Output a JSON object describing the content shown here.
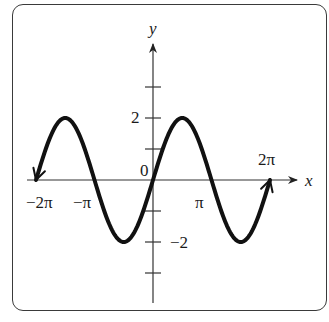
{
  "chart_data": {
    "type": "line",
    "title": "",
    "function": "y = 2 sin x",
    "xlabel": "x",
    "ylabel": "y",
    "xlim": [
      -6.2832,
      6.2832
    ],
    "ylim": [
      -4,
      4
    ],
    "grid": false,
    "x_tick_labels": [
      "−2π",
      "−π",
      "π",
      "2π"
    ],
    "x_tick_values": [
      -6.2832,
      -3.1416,
      3.1416,
      6.2832
    ],
    "y_tick_values": [
      -3,
      -2,
      -1,
      1,
      2,
      3
    ],
    "y_tick_labels": {
      "2": "2",
      "-2": "−2"
    },
    "origin_label": "0",
    "series": [
      {
        "name": "2 sin x",
        "x": [
          -6.2832,
          -4.7124,
          -3.1416,
          -1.5708,
          0,
          1.5708,
          3.1416,
          4.7124,
          6.2832
        ],
        "values": [
          0,
          2,
          0,
          -2,
          0,
          2,
          0,
          -2,
          0
        ],
        "end_arrows": true
      }
    ],
    "colors": {
      "curve": "#111111",
      "axes": "#333333",
      "frame": "#3a3a3a"
    }
  },
  "labels": {
    "x_axis": "x",
    "y_axis": "y",
    "origin": "0",
    "neg_two_pi": "−2π",
    "neg_pi": "−π",
    "pi": "π",
    "two_pi": "2π",
    "y_two": "2",
    "y_neg_two": "−2"
  }
}
